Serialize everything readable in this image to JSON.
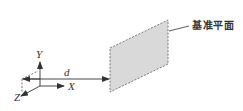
{
  "diagram": {
    "plane_label": "基准平面",
    "distance_label": "d",
    "axes": {
      "x_label": "X",
      "y_label": "Y",
      "z_label": "Z"
    },
    "colors": {
      "plane_fill": "#d9d9d9",
      "plane_edge": "#777777",
      "line": "#333333",
      "background": "#ffffff"
    }
  }
}
